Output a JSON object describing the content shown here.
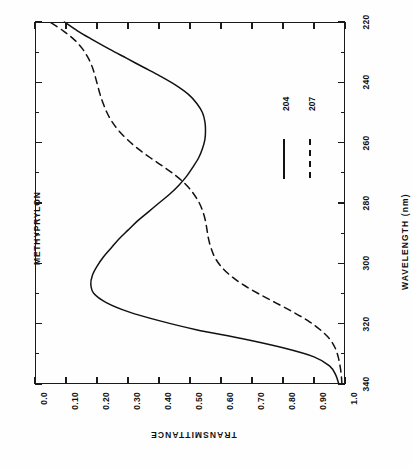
{
  "figure": {
    "sample_name": "METHYPRYLON",
    "transmittance_axis_title": "TRANSMITTANCE",
    "wavelength_axis_title": "WAVELENGTH  (nm)",
    "orientation_note": "sideways"
  },
  "legend": {
    "entries": [
      {
        "label": "204",
        "style": "solid"
      },
      {
        "label": "207",
        "style": "dashed"
      }
    ]
  },
  "transmittance_ticks": [
    "1.0",
    "0.90",
    "0.80",
    "0.70",
    "0.60",
    "0.50",
    "0.40",
    "0.30",
    "0.20",
    "0.10",
    "0.0"
  ],
  "wavelength_ticks": [
    "340",
    "320",
    "300",
    "280",
    "260",
    "240",
    "220"
  ],
  "chart_data": {
    "type": "line",
    "title": "METHYPRYLON",
    "xlabel": "WAVELENGTH  (nm)",
    "ylabel": "TRANSMITTANCE",
    "xlim": [
      220,
      340
    ],
    "ylim": [
      0.0,
      1.0
    ],
    "xticks": [
      220,
      240,
      260,
      280,
      300,
      320,
      340
    ],
    "yticks": [
      0.0,
      0.1,
      0.2,
      0.3,
      0.4,
      0.5,
      0.6,
      0.7,
      0.8,
      0.9,
      1.0
    ],
    "grid": false,
    "legend_position": "inside-right",
    "rotated_90deg": true,
    "series": [
      {
        "name": "204",
        "style": "solid",
        "x": [
          220,
          223,
          226,
          229,
          232,
          235,
          238,
          241,
          244,
          247,
          250,
          253,
          256,
          259,
          262,
          265,
          268,
          271,
          274,
          277,
          280,
          283,
          286,
          289,
          292,
          295,
          298,
          301,
          304,
          307,
          310,
          313,
          316,
          319,
          322,
          325,
          328,
          331,
          334,
          337,
          340
        ],
        "y": [
          0.02,
          0.03,
          0.05,
          0.1,
          0.2,
          0.33,
          0.48,
          0.6,
          0.7,
          0.77,
          0.81,
          0.82,
          0.815,
          0.8,
          0.78,
          0.755,
          0.73,
          0.7,
          0.67,
          0.635,
          0.6,
          0.565,
          0.535,
          0.51,
          0.49,
          0.472,
          0.46,
          0.452,
          0.45,
          0.452,
          0.46,
          0.478,
          0.505,
          0.545,
          0.595,
          0.65,
          0.705,
          0.76,
          0.812,
          0.862,
          0.905
        ]
      },
      {
        "name": "207",
        "style": "dashed",
        "x": [
          220,
          223,
          226,
          229,
          232,
          235,
          238,
          241,
          244,
          247,
          250,
          253,
          256,
          259,
          262,
          265,
          268,
          271,
          274,
          277,
          280,
          283,
          286,
          289,
          292,
          295,
          298,
          301,
          304,
          307,
          310,
          313,
          316,
          319,
          322,
          325,
          328,
          331,
          334,
          337,
          340
        ],
        "y": [
          0.01,
          0.012,
          0.016,
          0.022,
          0.032,
          0.05,
          0.08,
          0.12,
          0.17,
          0.225,
          0.28,
          0.33,
          0.37,
          0.4,
          0.42,
          0.432,
          0.44,
          0.445,
          0.45,
          0.458,
          0.47,
          0.488,
          0.512,
          0.545,
          0.585,
          0.628,
          0.668,
          0.702,
          0.73,
          0.752,
          0.768,
          0.78,
          0.79,
          0.798,
          0.806,
          0.815,
          0.828,
          0.846,
          0.872,
          0.908,
          0.952
        ]
      }
    ]
  }
}
